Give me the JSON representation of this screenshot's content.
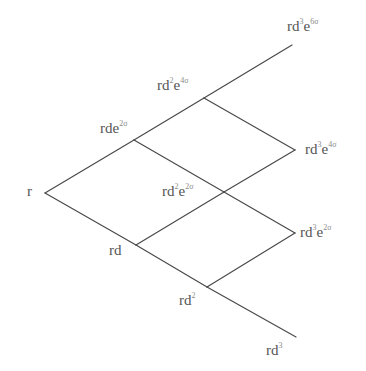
{
  "diagram": {
    "type": "binomial-interest-rate-lattice",
    "line_color": "#4a4a4a",
    "text_color": "#555555",
    "nodes": [
      {
        "id": "r",
        "x": 45,
        "y": 193,
        "label": "r",
        "sup1": "",
        "sup2": ""
      },
      {
        "id": "rde2s",
        "x": 134,
        "y": 140,
        "label": "rde",
        "sup1": "",
        "sup2": "2σ"
      },
      {
        "id": "rd",
        "x": 136,
        "y": 245,
        "label": "rd",
        "sup1": "",
        "sup2": ""
      },
      {
        "id": "rd2e4s",
        "x": 204,
        "y": 98,
        "label": "rd",
        "sup1": "2",
        "sup2": "4σ"
      },
      {
        "id": "rd2e2s",
        "x": 224,
        "y": 192,
        "label": "rd",
        "sup1": "2",
        "sup2": "2σ"
      },
      {
        "id": "rd2",
        "x": 207,
        "y": 287,
        "label": "rd",
        "sup1": "2",
        "sup2": ""
      },
      {
        "id": "rd3e6s",
        "x": 292,
        "y": 45,
        "label": "rd",
        "sup1": "3",
        "sup2": "6σ"
      },
      {
        "id": "rd3e4s",
        "x": 295,
        "y": 150,
        "label": "rd",
        "sup1": "3",
        "sup2": "4σ"
      },
      {
        "id": "rd3e2s",
        "x": 295,
        "y": 233,
        "label": "rd",
        "sup1": "3",
        "sup2": "2σ"
      },
      {
        "id": "rd3",
        "x": 296,
        "y": 337,
        "label": "rd",
        "sup1": "3",
        "sup2": ""
      }
    ],
    "edges": [
      [
        "r",
        "rde2s"
      ],
      [
        "r",
        "rd"
      ],
      [
        "rde2s",
        "rd2e4s"
      ],
      [
        "rde2s",
        "rd2e2s"
      ],
      [
        "rd",
        "rd2e2s"
      ],
      [
        "rd",
        "rd2"
      ],
      [
        "rd2e4s",
        "rd3e6s"
      ],
      [
        "rd2e4s",
        "rd3e4s"
      ],
      [
        "rd2e2s",
        "rd3e4s"
      ],
      [
        "rd2e2s",
        "rd3e2s"
      ],
      [
        "rd2",
        "rd3e2s"
      ],
      [
        "rd2",
        "rd3"
      ]
    ],
    "labels": {
      "r": {
        "base": "r"
      },
      "rde2s": {
        "base": "rde",
        "exp2": "2σ"
      },
      "rd": {
        "base": "rd"
      },
      "rd2e4s": {
        "base": "rd",
        "exp1": "2",
        "mid": "e",
        "exp2": "4σ"
      },
      "rd2e2s": {
        "base": "rd",
        "exp1": "2",
        "mid": "e",
        "exp2": "2σ"
      },
      "rd2": {
        "base": "rd",
        "exp1": "2"
      },
      "rd3e6s": {
        "base": "rd",
        "exp1": "3",
        "mid": "e",
        "exp2": "6σ"
      },
      "rd3e4s": {
        "base": "rd",
        "exp1": "3",
        "mid": "e",
        "exp2": "4σ"
      },
      "rd3e2s": {
        "base": "rd",
        "exp1": "3",
        "mid": "e",
        "exp2": "2σ"
      },
      "rd3": {
        "base": "rd",
        "exp1": "3"
      }
    }
  }
}
